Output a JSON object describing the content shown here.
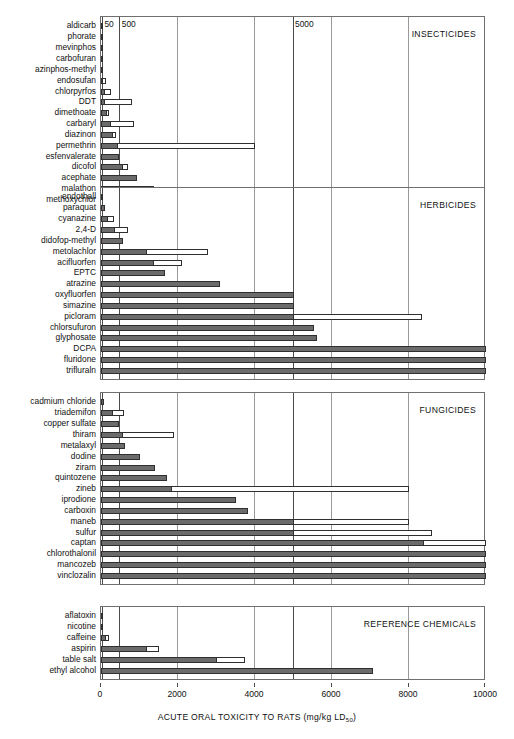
{
  "chart_data": {
    "type": "bar",
    "title": "",
    "xlabel": "ACUTE ORAL TOXICITY TO RATS (mg/kg LD 50)",
    "xlabel_main": "ACUTE ORAL TOXICITY TO RATS (mg/kg LD",
    "xlabel_sub": "50",
    "xlabel_tail": ")",
    "ylabel": "",
    "orientation": "horizontal",
    "xlim": [
      0,
      10000
    ],
    "xticks": [
      0,
      2000,
      4000,
      6000,
      8000,
      10000
    ],
    "xtick_labels": [
      "0",
      "2000",
      "4000",
      "6000",
      "8000",
      "10000"
    ],
    "top_ticks": [
      {
        "value": 50,
        "label": "50"
      },
      {
        "value": 500,
        "label": "500"
      },
      {
        "value": 5000,
        "label": "5000"
      }
    ],
    "grid": true,
    "legend_position": "none",
    "series": [
      {
        "name": "lower LD50 estimate",
        "color": "#6b6b6b",
        "style": "filled-grey"
      },
      {
        "name": "upper LD50 range",
        "color": "#ffffff",
        "style": "open-white"
      }
    ],
    "panels": [
      {
        "title": "INSECTICIDES",
        "categories": [
          "aldicarb",
          "phorate",
          "mevinphos",
          "carbofuran",
          "azinphos-methyl",
          "endosufan",
          "chlorpyrfos",
          "DDT",
          "dimethoate",
          "carbaryl",
          "diazinon",
          "permethrin",
          "esfenvalerate",
          "dicofol",
          "acephate",
          "malathon",
          "methoxychlor"
        ],
        "low": [
          1,
          2,
          4,
          8,
          13,
          18,
          96,
          113,
          150,
          250,
          300,
          430,
          458,
          575,
          945,
          1375,
          5000
        ],
        "high": [
          1,
          2,
          4,
          8,
          13,
          110,
          270,
          800,
          215,
          850,
          400,
          4000,
          458,
          690,
          945,
          1375,
          6000
        ]
      },
      {
        "title": "HERBICIDES",
        "categories": [
          "endothall",
          "paraquat",
          "cyanazine",
          "2,4-D",
          "didofop-methyl",
          "metolachlor",
          "acifluorfen",
          "EPTC",
          "atrazine",
          "oxyfluorfen",
          "simazine",
          "picloram",
          "chlorsufuron",
          "glyphosate",
          "DCPA",
          "fluridone",
          "trifluraln"
        ],
        "low": [
          38,
          110,
          180,
          375,
          565,
          1200,
          1370,
          1650,
          3080,
          5000,
          5000,
          5000,
          5545,
          5600,
          10000,
          10000,
          10000
        ],
        "high": [
          38,
          110,
          330,
          700,
          565,
          2780,
          2100,
          1650,
          3080,
          5000,
          5000,
          8350,
          5545,
          5600,
          10000,
          10000,
          10000
        ]
      },
      {
        "title": "FUNGICIDES",
        "categories": [
          "cadmium chloride",
          "triademifon",
          "copper sulfate",
          "thiram",
          "metalaxyl",
          "dodine",
          "ziram",
          "quintozene",
          "zineb",
          "iprodione",
          "carboxin",
          "maneb",
          "sulfur",
          "captan",
          "chlorothalonil",
          "mancozeb",
          "vinclozalin"
        ],
        "low": [
          88,
          300,
          470,
          560,
          633,
          1000,
          1400,
          1710,
          1850,
          3500,
          3820,
          5000,
          5000,
          8400,
          10000,
          10000,
          10000
        ],
        "high": [
          88,
          600,
          470,
          1900,
          633,
          1000,
          1400,
          1710,
          8000,
          3500,
          3820,
          8000,
          8600,
          10000,
          10000,
          10000,
          10000
        ]
      },
      {
        "title": "REFERENCE CHEMICALS",
        "categories": [
          "aflatoxin",
          "nicotine",
          "caffeine",
          "aspirin",
          "table salt",
          "ethyl alcohol"
        ],
        "low": [
          7,
          53,
          130,
          1200,
          3000,
          7060
        ],
        "high": [
          7,
          53,
          200,
          1500,
          3750,
          7060
        ]
      }
    ]
  }
}
